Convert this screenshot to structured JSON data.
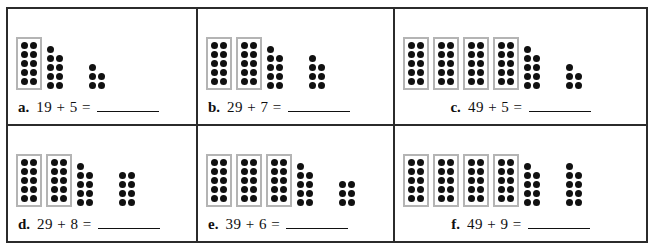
{
  "worksheet": {
    "title": "Base-ten dot addition worksheet",
    "answer_blank": "",
    "colors": {
      "dot": "#111111",
      "ten_frame_border": "#b4b4b4",
      "table_border": "#2b2b2b",
      "page_background": "#ffffff"
    },
    "problems": [
      {
        "label": "a.",
        "expression": "19 + 5 =",
        "align": "left",
        "addend1": 19,
        "addend2": 5,
        "ten_blocks": 1,
        "ones_group_1": {
          "left_column": 5,
          "right_column": 4,
          "total": 9
        },
        "ones_group_2": {
          "left_column": 3,
          "right_column": 2,
          "total": 5
        }
      },
      {
        "label": "b.",
        "expression": "29 + 7 =",
        "align": "left",
        "addend1": 29,
        "addend2": 7,
        "ten_blocks": 2,
        "ones_group_1": {
          "left_column": 5,
          "right_column": 4,
          "total": 9
        },
        "ones_group_2": {
          "left_column": 4,
          "right_column": 3,
          "total": 7
        }
      },
      {
        "label": "c.",
        "expression": "49 + 5 =",
        "align": "center",
        "addend1": 49,
        "addend2": 5,
        "ten_blocks": 4,
        "ones_group_1": {
          "left_column": 5,
          "right_column": 4,
          "total": 9
        },
        "ones_group_2": {
          "left_column": 3,
          "right_column": 2,
          "total": 5
        }
      },
      {
        "label": "d.",
        "expression": "29 + 8 =",
        "align": "left",
        "addend1": 29,
        "addend2": 8,
        "ten_blocks": 2,
        "ones_group_1": {
          "left_column": 5,
          "right_column": 4,
          "total": 9
        },
        "ones_group_2": {
          "left_column": 4,
          "right_column": 4,
          "total": 8
        }
      },
      {
        "label": "e.",
        "expression": "39 + 6 =",
        "align": "left",
        "addend1": 39,
        "addend2": 6,
        "ten_blocks": 3,
        "ones_group_1": {
          "left_column": 5,
          "right_column": 4,
          "total": 9
        },
        "ones_group_2": {
          "left_column": 3,
          "right_column": 3,
          "total": 6
        }
      },
      {
        "label": "f.",
        "expression": "49 + 9 =",
        "align": "center",
        "addend1": 49,
        "addend2": 9,
        "ten_blocks": 4,
        "ones_group_1": {
          "left_column": 5,
          "right_column": 4,
          "total": 9
        },
        "ones_group_2": {
          "left_column": 5,
          "right_column": 4,
          "total": 9
        }
      }
    ]
  }
}
